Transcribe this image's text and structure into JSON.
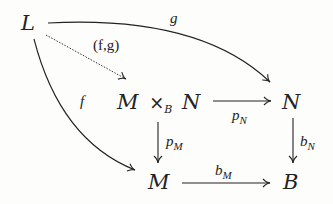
{
  "diagram": {
    "type": "commutative-diagram-pullback",
    "nodes": {
      "L": "L",
      "pullback": {
        "left": "M",
        "op": "×",
        "sub": "B",
        "right": "N"
      },
      "N": "N",
      "M": "M",
      "B": "B"
    },
    "arrows": {
      "g": {
        "label": "g",
        "from": "L",
        "to": "N",
        "style": "solid-curved"
      },
      "fg": {
        "label": "(f,g)",
        "from": "L",
        "to": "M ×_B N",
        "style": "dotted"
      },
      "f": {
        "label": "f",
        "from": "L",
        "to": "M",
        "style": "solid-curved"
      },
      "pN": {
        "label": "p",
        "sub": "N",
        "from": "M ×_B N",
        "to": "N",
        "style": "solid"
      },
      "pM": {
        "label": "p",
        "sub": "M",
        "from": "M ×_B N",
        "to": "M",
        "style": "solid"
      },
      "bN": {
        "label": "b",
        "sub": "N",
        "from": "N",
        "to": "B",
        "style": "solid"
      },
      "bM": {
        "label": "b",
        "sub": "M",
        "from": "M",
        "to": "B",
        "style": "solid"
      }
    },
    "colors": {
      "ink": "#222222",
      "background": "#fdfdfc"
    }
  }
}
